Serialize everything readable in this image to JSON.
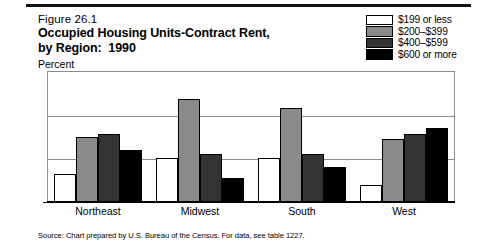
{
  "figure": {
    "number": "Figure 26.1",
    "title_line1": "Occupied Housing Units-Contract Rent,",
    "title_line2": "by Region:  1990",
    "unit_label": "Percent",
    "source": "Source: Chart prepared by U.S. Bureau of the Census. For data, see table 1227."
  },
  "colors": {
    "series1": "#ffffff",
    "series2": "#8a8a8a",
    "series3": "#333333",
    "series4": "#000000",
    "grid": "#8d8d8d",
    "axis": "#000000",
    "rule": "#111111"
  },
  "chart_data": {
    "type": "bar",
    "title": "Occupied Housing Units-Contract Rent, by Region:  1990",
    "xlabel": "",
    "ylabel": "Percent",
    "ylim": [
      0,
      60
    ],
    "yticks": [
      0,
      20,
      40,
      60
    ],
    "grid": true,
    "legend_position": "top-right",
    "categories": [
      "Northeast",
      "Midwest",
      "South",
      "West"
    ],
    "series": [
      {
        "name": "$199 or less",
        "color": "#ffffff",
        "values": [
          13,
          20,
          20,
          8
        ]
      },
      {
        "name": "$200–$399",
        "color": "#8a8a8a",
        "values": [
          30,
          47,
          43,
          29
        ]
      },
      {
        "name": "$400–$599",
        "color": "#333333",
        "values": [
          31,
          22,
          22,
          31
        ]
      },
      {
        "name": "$600 or more",
        "color": "#000000",
        "values": [
          24,
          11,
          16,
          34
        ]
      }
    ]
  }
}
